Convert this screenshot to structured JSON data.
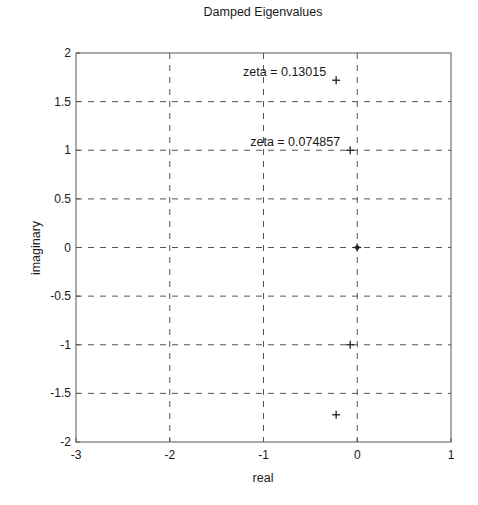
{
  "chart_data": {
    "type": "scatter",
    "title": "Damped Eigenvalues",
    "xlabel": "real",
    "ylabel": "imaginary",
    "xlim": [
      -3,
      1
    ],
    "ylim": [
      -2,
      2
    ],
    "xticks": [
      -3,
      -2,
      -1,
      0,
      1
    ],
    "yticks": [
      -2,
      -1.5,
      -1,
      -0.5,
      0,
      0.5,
      1,
      1.5,
      2
    ],
    "xtick_labels": [
      "-3",
      "-2",
      "-1",
      "0",
      "1"
    ],
    "ytick_labels": [
      "-2",
      "-1.5",
      "-1",
      "-0.5",
      "0",
      "0.5",
      "1",
      "1.5",
      "2"
    ],
    "grid": true,
    "grid_style": "dashed",
    "marker": "+",
    "series": [
      {
        "name": "eigenvalues",
        "points": [
          {
            "x": -0.225,
            "y": 1.72
          },
          {
            "x": -0.075,
            "y": 1.0
          },
          {
            "x": 0.0,
            "y": 0.0
          },
          {
            "x": -0.075,
            "y": -1.0
          },
          {
            "x": -0.225,
            "y": -1.72
          }
        ]
      }
    ],
    "annotations": [
      {
        "text": "zeta = 0.13015",
        "x": -0.225,
        "y": 1.72
      },
      {
        "text": "zeta = 0.074857",
        "x": -0.075,
        "y": 1.0
      }
    ]
  },
  "layout": {
    "plot_left": 76,
    "plot_right": 451,
    "plot_top": 53,
    "plot_bottom": 442,
    "axis_color": "#555555",
    "grid_color": "#555555",
    "marker_color": "#222222"
  }
}
